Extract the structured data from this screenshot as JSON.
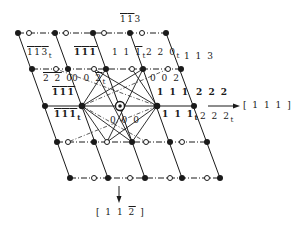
{
  "diagram": {
    "colors": {
      "ink": "#1a1a1a",
      "background": "#ffffff"
    },
    "rows": [
      {
        "y": 33,
        "filled": [
          18,
          55,
          93,
          130,
          166
        ],
        "open": [
          29,
          66,
          104,
          142
        ]
      },
      {
        "y": 69,
        "filled": [
          32,
          68,
          106,
          143,
          181
        ],
        "open": [
          56,
          94,
          132,
          168
        ]
      },
      {
        "y": 106,
        "filled": [
          45,
          82,
          157,
          194
        ],
        "open": [],
        "origin": 120
      },
      {
        "y": 142,
        "filled": [
          57,
          94,
          132,
          170,
          207
        ],
        "open": [
          68,
          107,
          146,
          182
        ]
      },
      {
        "y": 178,
        "filled": [
          70,
          108,
          145,
          182,
          220
        ],
        "open": [
          94,
          130,
          170,
          207
        ]
      }
    ],
    "labels": {
      "l_113bar_top": {
        "parts": [
          "1",
          "1"
        ],
        "tail": "3"
      },
      "l_113t": {
        "parts": [
          "1",
          "1",
          "3"
        ],
        "sub": "t"
      },
      "l_111bar_a": {
        "parts": [
          "1",
          "1",
          "1"
        ]
      },
      "l_111t_a": {
        "text": "1 1 ",
        "bar": "1",
        "sub": "t"
      },
      "l_220t": {
        "text": "2 2 0",
        "sub": "t"
      },
      "l_113": {
        "text": "1 1 3"
      },
      "l_220bar": {
        "bar": "2 2",
        "text": " 0"
      },
      "l_002t": {
        "text": "0 0 ",
        "bar": "2",
        "sub": "t"
      },
      "l_002": {
        "text": "0 0 2"
      },
      "l_111bar_b": {
        "parts": [
          "1",
          "1",
          "1"
        ]
      },
      "l_111": {
        "text": "1 1 1"
      },
      "l_222": {
        "text": "2 2 2"
      },
      "l_111bar_t": {
        "parts": [
          "1",
          "1",
          "1"
        ],
        "sub": "t"
      },
      "l_000": {
        "text": "0 0 0"
      },
      "l_111t": {
        "text": "1 1 1",
        "sub": "t"
      },
      "l_222t": {
        "text": "2 2 2",
        "sub": "t"
      }
    },
    "axes": {
      "horizontal": {
        "label": "[ 1 1 1 ]"
      },
      "vertical": {
        "label_pre": "[ 1 1 ",
        "label_bar": "2",
        "label_post": " ]"
      }
    }
  }
}
